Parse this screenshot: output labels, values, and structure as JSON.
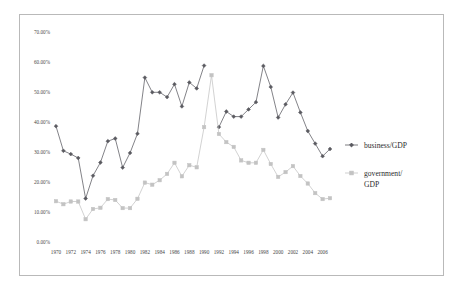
{
  "chart_data": {
    "type": "line",
    "title": "",
    "xlabel": "",
    "ylabel": "",
    "ylim": [
      0,
      0.7
    ],
    "ytick_labels": [
      "0.00%",
      "10.00%",
      "20.00%",
      "30.00%",
      "40.00%",
      "50.00%",
      "60.00%",
      "70.00%"
    ],
    "ytick_values": [
      0,
      10,
      20,
      30,
      40,
      50,
      60,
      70
    ],
    "grid": false,
    "legend_position": "right",
    "x": [
      1970,
      1971,
      1972,
      1973,
      1974,
      1975,
      1976,
      1977,
      1978,
      1979,
      1980,
      1981,
      1982,
      1983,
      1984,
      1985,
      1986,
      1987,
      1988,
      1989,
      1990,
      1991,
      1992,
      1993,
      1994,
      1995,
      1996,
      1997,
      1998,
      1999,
      2000,
      2001,
      2002,
      2003,
      2004,
      2005,
      2006,
      2007
    ],
    "xtick_labels": [
      "1970",
      "1972",
      "1974",
      "1976",
      "1978",
      "1980",
      "1982",
      "1984",
      "1986",
      "1988",
      "1990",
      "1992",
      "1994",
      "1996",
      "1998",
      "2000",
      "2002",
      "2004",
      "2006"
    ],
    "series": [
      {
        "name": "business/GDP",
        "color": "#5a5a60",
        "marker": "diamond",
        "values": [
          38.6,
          30.4,
          29.3,
          28.0,
          14.5,
          22.1,
          26.5,
          33.6,
          34.5,
          24.8,
          29.7,
          36.1,
          54.8,
          49.9,
          49.9,
          48.3,
          52.6,
          45.2,
          53.2,
          51.2,
          58.8,
          null,
          38.3,
          43.5,
          41.8,
          41.8,
          44.2,
          46.6,
          58.7,
          51.7,
          41.5,
          45.9,
          49.8,
          43.2,
          37.0,
          32.8,
          28.6,
          31.0
        ]
      },
      {
        "name": "government/GDP",
        "color": "#c3c3c3",
        "marker": "square",
        "values": [
          13.6,
          12.6,
          13.5,
          13.5,
          7.6,
          11.0,
          11.4,
          14.3,
          14.0,
          11.3,
          11.3,
          14.4,
          19.8,
          19.1,
          20.6,
          22.7,
          26.4,
          21.9,
          25.6,
          24.9,
          38.3,
          55.6,
          36.0,
          33.3,
          31.7,
          27.2,
          26.4,
          26.4,
          30.7,
          26.0,
          21.7,
          23.3,
          25.3,
          22.0,
          19.5,
          16.3,
          14.3,
          14.6
        ]
      }
    ]
  },
  "legend": {
    "items": [
      {
        "label": "business/GDP",
        "color": "#5a5a60"
      },
      {
        "label": "government/",
        "label2": "GDP",
        "color": "#c3c3c3"
      }
    ]
  }
}
